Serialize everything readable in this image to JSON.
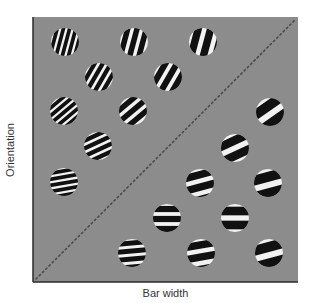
{
  "figure": {
    "ylabel": "Orientation",
    "xlabel": "Bar width",
    "background": "#8c8c8c",
    "frame": {
      "x": 33,
      "y": 17,
      "w": 265,
      "h": 265
    },
    "diagonal": "dotted line from bottom-left to top-right",
    "stimuli_upper_left": [
      {
        "cx": 65,
        "cy": 42,
        "angle": 75,
        "period": 6
      },
      {
        "cx": 134,
        "cy": 42,
        "angle": 75,
        "period": 9
      },
      {
        "cx": 203,
        "cy": 42,
        "angle": 75,
        "period": 12
      },
      {
        "cx": 99,
        "cy": 77,
        "angle": 60,
        "period": 7
      },
      {
        "cx": 168,
        "cy": 77,
        "angle": 60,
        "period": 10
      },
      {
        "cx": 64,
        "cy": 111,
        "angle": 40,
        "period": 6
      },
      {
        "cx": 133,
        "cy": 111,
        "angle": 40,
        "period": 9
      },
      {
        "cx": 98,
        "cy": 146,
        "angle": 25,
        "period": 7
      },
      {
        "cx": 64,
        "cy": 182,
        "angle": 10,
        "period": 6
      }
    ],
    "stimuli_lower_right": [
      {
        "cx": 270,
        "cy": 112,
        "angle": 35,
        "period": 16
      },
      {
        "cx": 235,
        "cy": 148,
        "angle": 25,
        "period": 14
      },
      {
        "cx": 200,
        "cy": 183,
        "angle": 15,
        "period": 12
      },
      {
        "cx": 268,
        "cy": 183,
        "angle": 15,
        "period": 16
      },
      {
        "cx": 167,
        "cy": 218,
        "angle": 0,
        "period": 10
      },
      {
        "cx": 235,
        "cy": 218,
        "angle": 0,
        "period": 14
      },
      {
        "cx": 132,
        "cy": 253,
        "angle": 5,
        "period": 8
      },
      {
        "cx": 201,
        "cy": 253,
        "angle": 10,
        "period": 12
      },
      {
        "cx": 269,
        "cy": 253,
        "angle": 15,
        "period": 16
      }
    ],
    "radius": 14
  }
}
